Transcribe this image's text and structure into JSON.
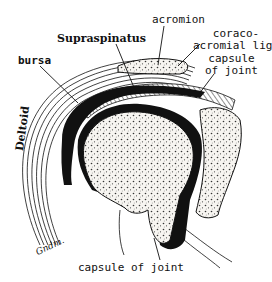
{
  "figure": {
    "labels": {
      "acromion": "acromion",
      "supraspinatus": "Supraspinatus",
      "bursa": "bursa",
      "coracoacromial_1": "coraco-",
      "coracoacromial_2": "acromial lig.",
      "capsule_right_1": "capsule",
      "capsule_right_2": "of joint",
      "capsule_bottom": "capsule of joint",
      "deltoid": "Deltoid",
      "signature": "Gndm."
    },
    "colors": {
      "ink": "#111111",
      "background": "#ffffff",
      "bone_fill": "#f4f2ee"
    }
  }
}
